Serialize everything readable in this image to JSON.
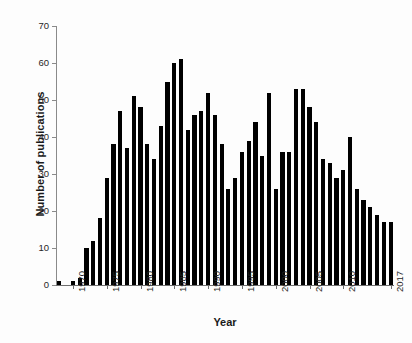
{
  "chart_data": {
    "type": "bar",
    "title": "",
    "xlabel": "Year",
    "ylabel": "Number of publications",
    "ylim": [
      0,
      70
    ],
    "yticks": [
      0,
      10,
      20,
      30,
      40,
      50,
      60,
      70
    ],
    "ytick_labels": [
      "0",
      "10",
      "20",
      "30",
      "40",
      "50",
      "60",
      "70"
    ],
    "xtick_labels": [
      "1970",
      "1975",
      "1980",
      "1985",
      "1990",
      "1995",
      "2000",
      "2005",
      "2010",
      "2017"
    ],
    "grid": false,
    "legend": null,
    "bar_color": "#000000",
    "categories": [
      "1968",
      "1969",
      "1970",
      "1971",
      "1972",
      "1973",
      "1974",
      "1975",
      "1976",
      "1977",
      "1978",
      "1979",
      "1980",
      "1981",
      "1982",
      "1983",
      "1984",
      "1985",
      "1986",
      "1987",
      "1988",
      "1989",
      "1990",
      "1991",
      "1992",
      "1993",
      "1994",
      "1995",
      "1996",
      "1997",
      "1998",
      "1999",
      "2000",
      "2001",
      "2002",
      "2003",
      "2004",
      "2005",
      "2006",
      "2007",
      "2008",
      "2009",
      "2010",
      "2011",
      "2012",
      "2013",
      "2014",
      "2015",
      "2016",
      "2017"
    ],
    "values": [
      1,
      0,
      1,
      2,
      10,
      12,
      18,
      29,
      38,
      47,
      37,
      51,
      48,
      38,
      34,
      43,
      55,
      60,
      61,
      42,
      46,
      47,
      52,
      46,
      38,
      26,
      29,
      36,
      39,
      44,
      35,
      52,
      26,
      36,
      36,
      53,
      53,
      48,
      44,
      34,
      33,
      29,
      31,
      40,
      26,
      23,
      21,
      19,
      17,
      17
    ]
  }
}
